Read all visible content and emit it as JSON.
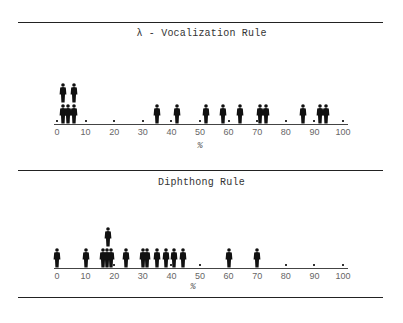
{
  "figure": {
    "rules_y": [
      22,
      170,
      297
    ]
  },
  "chart_data": [
    {
      "type": "scatter",
      "subtype": "isotype-pictogram (stacked person icons)",
      "title": "λ - Vocalization Rule",
      "xlabel": "%",
      "ylabel": "",
      "xlim": [
        0,
        100
      ],
      "x_ticks": [
        0,
        10,
        20,
        30,
        40,
        50,
        60,
        70,
        80,
        90,
        100
      ],
      "grid": false,
      "legend": null,
      "description": "Each person icon represents one subject; icons stacked when values coincide",
      "points": [
        {
          "x": 2,
          "stack": 0
        },
        {
          "x": 2,
          "stack": 1
        },
        {
          "x": 4,
          "stack": 0
        },
        {
          "x": 6,
          "stack": 0
        },
        {
          "x": 6,
          "stack": 1
        },
        {
          "x": 35,
          "stack": 0
        },
        {
          "x": 42,
          "stack": 0
        },
        {
          "x": 52,
          "stack": 0
        },
        {
          "x": 58,
          "stack": 0
        },
        {
          "x": 64,
          "stack": 0
        },
        {
          "x": 71,
          "stack": 0
        },
        {
          "x": 73,
          "stack": 0
        },
        {
          "x": 86,
          "stack": 0
        },
        {
          "x": 92,
          "stack": 0
        },
        {
          "x": 94,
          "stack": 0
        }
      ],
      "count": 15
    },
    {
      "type": "scatter",
      "subtype": "isotype-pictogram (stacked person icons)",
      "title": "Diphthong Rule",
      "xlabel": "%",
      "ylabel": "",
      "xlim": [
        0,
        100
      ],
      "x_ticks": [
        0,
        10,
        20,
        30,
        40,
        50,
        60,
        70,
        80,
        90,
        100
      ],
      "grid": false,
      "legend": null,
      "description": "Each person icon represents one subject; icons stacked when values coincide",
      "points": [
        {
          "x": 0,
          "stack": 0
        },
        {
          "x": 10,
          "stack": 0
        },
        {
          "x": 16,
          "stack": 0
        },
        {
          "x": 17.5,
          "stack": 0
        },
        {
          "x": 19,
          "stack": 0
        },
        {
          "x": 18,
          "stack": 1
        },
        {
          "x": 24,
          "stack": 0
        },
        {
          "x": 30,
          "stack": 0
        },
        {
          "x": 31.5,
          "stack": 0
        },
        {
          "x": 35,
          "stack": 0
        },
        {
          "x": 38,
          "stack": 0
        },
        {
          "x": 41,
          "stack": 0
        },
        {
          "x": 44,
          "stack": 0
        },
        {
          "x": 60,
          "stack": 0
        },
        {
          "x": 70,
          "stack": 0
        }
      ],
      "count": 15
    }
  ]
}
